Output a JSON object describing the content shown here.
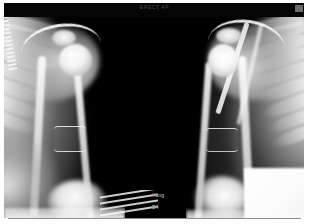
{
  "viewer": {
    "modality_label": "radiograph-viewer",
    "background_color": "#000000",
    "film_margin_color": "#ffffff"
  },
  "header": {
    "banner_text": "ERECT AP"
  },
  "overlay": {
    "patient_name": "Yang",
    "view_code": "D4"
  },
  "panels": [
    {
      "id": "panel-left",
      "name": "left-shoulder-radiograph",
      "side_label": "left",
      "region": "shoulder-humerus",
      "findings": [
        "humeral-head",
        "acromion",
        "clavicle",
        "scapula",
        "rib-cage",
        "humeral-shaft",
        "serrated-fixation-device",
        "mid-shaft-cuff-band",
        "elbow-soft-tissue"
      ],
      "rib_count": 8
    },
    {
      "id": "panel-right",
      "name": "right-shoulder-radiograph",
      "side_label": "right",
      "region": "shoulder-humerus",
      "findings": [
        "humeral-head",
        "acromion",
        "clavicle",
        "scapula",
        "rib-cage",
        "humeral-shaft",
        "diagonal-wire-artifact",
        "mid-shaft-cuff-band",
        "elbow-soft-tissue",
        "overexposed-block"
      ],
      "rib_count": 9
    }
  ],
  "markers": {
    "corner_marker": "side-marker"
  }
}
